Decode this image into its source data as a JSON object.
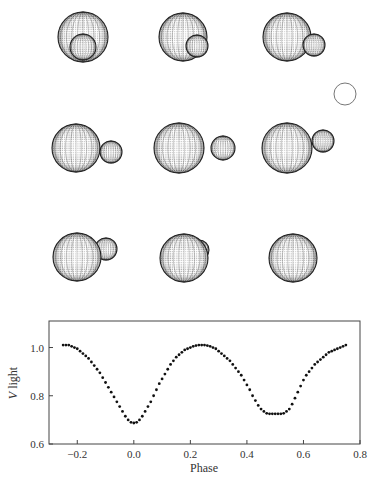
{
  "figure": {
    "reference_circle": {
      "cx": 345,
      "cy": 94,
      "r": 11
    },
    "panels": [
      {
        "row": 0,
        "col": 0,
        "primary": {
          "cx": 83,
          "cy": 37,
          "r": 25
        },
        "secondary": {
          "cx": 83,
          "cy": 47,
          "r": 13
        },
        "secondary_in_front": true
      },
      {
        "row": 0,
        "col": 1,
        "primary": {
          "cx": 183,
          "cy": 37,
          "r": 24
        },
        "secondary": {
          "cx": 197,
          "cy": 46,
          "r": 11
        },
        "secondary_in_front": true
      },
      {
        "row": 0,
        "col": 2,
        "primary": {
          "cx": 287,
          "cy": 37,
          "r": 24
        },
        "secondary": {
          "cx": 314,
          "cy": 45,
          "r": 11
        },
        "secondary_in_front": true
      },
      {
        "row": 1,
        "col": 0,
        "primary": {
          "cx": 76,
          "cy": 148,
          "r": 24
        },
        "secondary": {
          "cx": 111,
          "cy": 152,
          "r": 11
        },
        "secondary_in_front": true
      },
      {
        "row": 1,
        "col": 1,
        "primary": {
          "cx": 179,
          "cy": 148,
          "r": 25
        },
        "secondary": {
          "cx": 223,
          "cy": 148,
          "r": 12
        },
        "secondary_in_front": true
      },
      {
        "row": 1,
        "col": 2,
        "primary": {
          "cx": 287,
          "cy": 148,
          "r": 25
        },
        "secondary": {
          "cx": 323,
          "cy": 141,
          "r": 11
        },
        "secondary_in_front": true
      },
      {
        "row": 2,
        "col": 0,
        "primary": {
          "cx": 77,
          "cy": 257,
          "r": 24
        },
        "secondary": {
          "cx": 106,
          "cy": 249,
          "r": 11
        },
        "secondary_in_front": false
      },
      {
        "row": 2,
        "col": 1,
        "primary": {
          "cx": 184,
          "cy": 258,
          "r": 24
        },
        "secondary": {
          "cx": 199,
          "cy": 250,
          "r": 10
        },
        "secondary_in_front": false
      },
      {
        "row": 2,
        "col": 2,
        "primary": {
          "cx": 293,
          "cy": 258,
          "r": 24
        },
        "secondary": null,
        "secondary_in_front": false
      }
    ]
  },
  "chart_data": {
    "type": "scatter",
    "title": "",
    "xlabel": "Phase",
    "ylabel_italic": "V",
    "ylabel_rest": " light",
    "ylabel": "V light",
    "xlim": [
      -0.3,
      0.8
    ],
    "ylim": [
      0.6,
      1.11
    ],
    "xticks": [
      -0.2,
      0.0,
      0.2,
      0.4,
      0.6,
      0.8
    ],
    "xtick_labels": [
      "−0.2",
      "0.0",
      "0.2",
      "0.4",
      "0.6",
      "0.8"
    ],
    "yticks": [
      0.6,
      0.8,
      1.0
    ],
    "ytick_labels": [
      "0.6",
      "0.8",
      "1.0"
    ],
    "grid": false,
    "legend": null,
    "series": [
      {
        "name": "V light",
        "x": [
          -0.25,
          -0.24,
          -0.23,
          -0.22,
          -0.21,
          -0.2,
          -0.19,
          -0.18,
          -0.17,
          -0.16,
          -0.15,
          -0.14,
          -0.13,
          -0.12,
          -0.11,
          -0.1,
          -0.09,
          -0.08,
          -0.07,
          -0.06,
          -0.05,
          -0.04,
          -0.03,
          -0.02,
          -0.01,
          0.0,
          0.01,
          0.02,
          0.03,
          0.04,
          0.05,
          0.06,
          0.07,
          0.08,
          0.09,
          0.1,
          0.11,
          0.12,
          0.13,
          0.14,
          0.15,
          0.16,
          0.17,
          0.18,
          0.19,
          0.2,
          0.21,
          0.22,
          0.23,
          0.24,
          0.25,
          0.26,
          0.27,
          0.28,
          0.29,
          0.3,
          0.31,
          0.32,
          0.33,
          0.34,
          0.35,
          0.36,
          0.37,
          0.38,
          0.39,
          0.4,
          0.41,
          0.42,
          0.43,
          0.44,
          0.45,
          0.46,
          0.47,
          0.48,
          0.49,
          0.5,
          0.51,
          0.52,
          0.53,
          0.54,
          0.55,
          0.56,
          0.57,
          0.58,
          0.59,
          0.6,
          0.61,
          0.62,
          0.63,
          0.64,
          0.65,
          0.66,
          0.67,
          0.68,
          0.69,
          0.7,
          0.71,
          0.72,
          0.73,
          0.74,
          0.75
        ],
        "y": [
          1.01,
          1.01,
          1.01,
          1.005,
          1.0,
          0.995,
          0.985,
          0.975,
          0.965,
          0.955,
          0.94,
          0.925,
          0.91,
          0.895,
          0.875,
          0.855,
          0.835,
          0.815,
          0.795,
          0.775,
          0.755,
          0.735,
          0.715,
          0.7,
          0.69,
          0.687,
          0.69,
          0.7,
          0.715,
          0.735,
          0.755,
          0.775,
          0.8,
          0.825,
          0.85,
          0.87,
          0.89,
          0.91,
          0.93,
          0.945,
          0.96,
          0.97,
          0.98,
          0.99,
          0.995,
          1.0,
          1.005,
          1.008,
          1.01,
          1.01,
          1.01,
          1.008,
          1.005,
          1.0,
          0.995,
          0.985,
          0.975,
          0.965,
          0.955,
          0.945,
          0.93,
          0.915,
          0.9,
          0.885,
          0.865,
          0.845,
          0.825,
          0.8,
          0.78,
          0.76,
          0.745,
          0.735,
          0.727,
          0.725,
          0.725,
          0.725,
          0.725,
          0.725,
          0.727,
          0.735,
          0.745,
          0.765,
          0.79,
          0.815,
          0.84,
          0.865,
          0.885,
          0.9,
          0.915,
          0.93,
          0.94,
          0.95,
          0.96,
          0.97,
          0.98,
          0.985,
          0.99,
          0.995,
          1.0,
          1.005,
          1.01
        ]
      }
    ],
    "plot_box_px": {
      "left": 49,
      "top": 321,
      "right": 360,
      "bottom": 444
    }
  }
}
